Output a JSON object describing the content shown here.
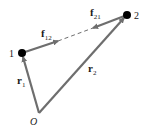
{
  "diagram": {
    "type": "vector-diagram",
    "colors": {
      "vector": "#6e6e6e",
      "particle": "#000000",
      "text": "#1a1a1a",
      "background": "#ffffff"
    },
    "origin": {
      "label": "O",
      "x": 39,
      "y": 113
    },
    "particles": [
      {
        "id": "1",
        "label": "1",
        "x": 22,
        "y": 53
      },
      {
        "id": "2",
        "label": "2",
        "x": 127,
        "y": 15
      }
    ],
    "position_vectors": [
      {
        "name": "r",
        "sub": "1",
        "from": "origin",
        "to": "1"
      },
      {
        "name": "r",
        "sub": "2",
        "from": "origin",
        "to": "2"
      }
    ],
    "force_vectors": [
      {
        "name": "f",
        "sub": "12",
        "on": "1",
        "toward": "2"
      },
      {
        "name": "f",
        "sub": "21",
        "on": "2",
        "toward": "1"
      }
    ],
    "connector": {
      "style": "dashed",
      "between": [
        "1",
        "2"
      ]
    }
  }
}
